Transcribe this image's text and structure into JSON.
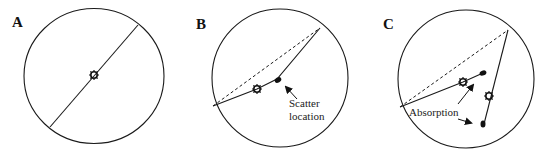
{
  "panels": [
    {
      "label": "A",
      "annotations": []
    },
    {
      "label": "B",
      "annotations": [
        "Scatter",
        "location"
      ]
    },
    {
      "label": "C",
      "annotations": [
        "Absorption"
      ]
    }
  ],
  "colors": {
    "stroke": "#1a1a1a",
    "background": "#ffffff"
  }
}
